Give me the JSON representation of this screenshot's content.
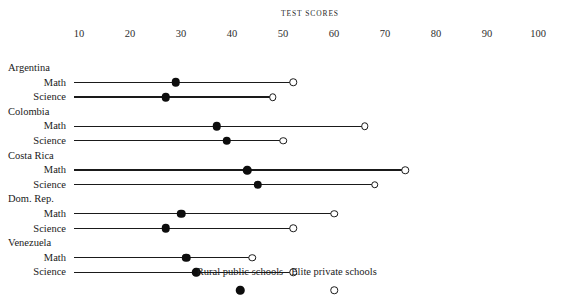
{
  "chart_data": {
    "type": "scatter",
    "title": "TEST SCORES",
    "xlabel": "",
    "ylabel": "",
    "xlim": [
      9,
      103
    ],
    "grid": false,
    "legend_position": "bottom",
    "tick_labels": [
      "10",
      "20",
      "30",
      "40",
      "50",
      "60",
      "70",
      "80",
      "90",
      "100"
    ],
    "tick_values": [
      10,
      20,
      30,
      40,
      50,
      60,
      70,
      80,
      90,
      100
    ],
    "legend": [
      {
        "name": "Rural public schools",
        "marker": "filled-circle"
      },
      {
        "name": "Elite private schools",
        "marker": "open-circle"
      }
    ],
    "series": [
      {
        "name": "Rural public schools",
        "values": [
          29,
          27,
          37,
          39,
          43,
          45,
          30,
          27,
          31,
          33
        ]
      },
      {
        "name": "Elite private schools",
        "values": [
          52,
          48,
          66,
          50,
          74,
          68,
          60,
          52,
          44,
          52
        ]
      }
    ],
    "groups": [
      {
        "country": "Argentina",
        "rows": [
          {
            "subject": "Math",
            "rural": 29,
            "elite": 52
          },
          {
            "subject": "Science",
            "rural": 27,
            "elite": 48
          }
        ]
      },
      {
        "country": "Colombia",
        "rows": [
          {
            "subject": "Math",
            "rural": 37,
            "elite": 66
          },
          {
            "subject": "Science",
            "rural": 39,
            "elite": 50
          }
        ]
      },
      {
        "country": "Costa Rica",
        "rows": [
          {
            "subject": "Math",
            "rural": 43,
            "elite": 74
          },
          {
            "subject": "Science",
            "rural": 45,
            "elite": 68
          }
        ]
      },
      {
        "country": "Dom. Rep.",
        "rows": [
          {
            "subject": "Math",
            "rural": 30,
            "elite": 60
          },
          {
            "subject": "Science",
            "rural": 27,
            "elite": 52
          }
        ]
      },
      {
        "country": "Venezuela",
        "rows": [
          {
            "subject": "Math",
            "rural": 31,
            "elite": 44
          },
          {
            "subject": "Science",
            "rural": 33,
            "elite": 52
          }
        ]
      }
    ]
  }
}
